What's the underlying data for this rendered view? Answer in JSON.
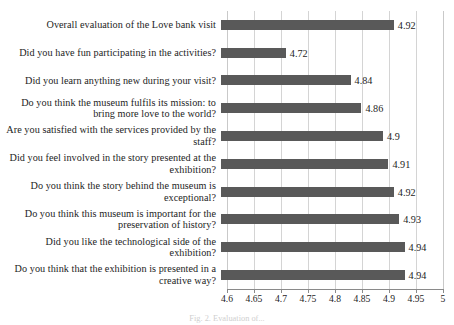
{
  "chart_data": {
    "type": "bar",
    "orientation": "horizontal",
    "title": "",
    "xlabel": "",
    "ylabel": "",
    "xlim": [
      4.6,
      5
    ],
    "xticks": [
      "4.6",
      "4.65",
      "4.7",
      "4.75",
      "4.8",
      "4.85",
      "4.9",
      "4.95",
      "5"
    ],
    "xtick_values": [
      4.6,
      4.65,
      4.7,
      4.75,
      4.8,
      4.85,
      4.9,
      4.95,
      5
    ],
    "grid": true,
    "legend": false,
    "bar_color": "#595959",
    "categories": [
      "Overall evaluation of the Love bank visit",
      "Did you have fun participating in the activities?",
      "Did you learn anything new during your visit?",
      "Do you think the museum fulfils its mission: to bring more love to the world?",
      "Are you satisfied with the services provided by the staff?",
      "Did you feel involved in the story presented at the exhibition?",
      "Do you think the story behind the museum is exceptional?",
      "Do you think this museum is important for the preservation of history?",
      "Did you like the technological side of the exhibition?",
      "Do you think that the exhibition is presented in a creative way?"
    ],
    "values": [
      4.92,
      4.72,
      4.84,
      4.86,
      4.9,
      4.91,
      4.92,
      4.93,
      4.94,
      4.94
    ],
    "data_labels": [
      "4.92",
      "4.72",
      "4.84",
      "4.86",
      "4.9",
      "4.91",
      "4.92",
      "4.93",
      "4.94",
      "4.94"
    ]
  },
  "caption": "Fig. 2. Evaluation of...",
  "caption_visible": false
}
